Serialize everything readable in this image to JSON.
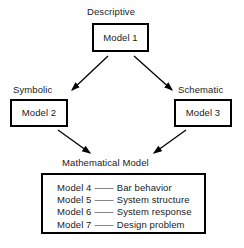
{
  "diagram": {
    "type": "flow-hierarchy",
    "nodes": {
      "model_1": {
        "label": "Model 1",
        "caption": "Descriptive"
      },
      "model_2": {
        "label": "Model 2",
        "caption": "Symbolic"
      },
      "model_3": {
        "label": "Model 3",
        "caption": "Schematic"
      },
      "model_list": {
        "caption": "Mathematical Model",
        "items": [
          {
            "model": "Model 4",
            "dash": "——",
            "description": "Bar behavior"
          },
          {
            "model": "Model 5",
            "dash": "——",
            "description": "System structure"
          },
          {
            "model": "Model 6",
            "dash": "——",
            "description": "System response"
          },
          {
            "model": "Model 7",
            "dash": "——",
            "description": "Design problem"
          }
        ]
      }
    },
    "edges": [
      {
        "from": "model_1",
        "to": "model_2"
      },
      {
        "from": "model_1",
        "to": "model_3"
      },
      {
        "from": "model_2",
        "to": "model_list"
      },
      {
        "from": "model_3",
        "to": "model_list"
      }
    ],
    "colors": {
      "stroke": "#000000",
      "background": "#ffffff",
      "text": "#1a1a1a"
    }
  }
}
